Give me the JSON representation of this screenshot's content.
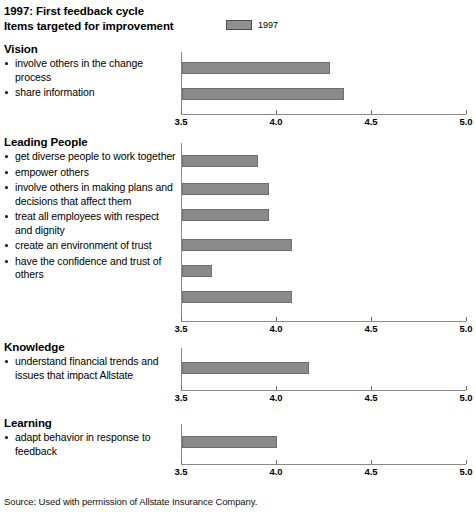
{
  "header": {
    "title_line1": "1997: First feedback cycle",
    "title_line2": "Items targeted for improvement",
    "legend_label": "1997",
    "legend_swatch_color": "#909090"
  },
  "footer": {
    "source": "Source: Used with permission of Allstate Insurance Company."
  },
  "axis": {
    "ticks": [
      "3.5",
      "4.0",
      "4.5",
      "5.0"
    ],
    "min": 3.5,
    "max": 5.0
  },
  "colors": {
    "bar_fill": "#8a8a8a",
    "bar_border": "#6e6e6e",
    "axis": "#8a8a8a",
    "text": "#000000"
  },
  "sections": [
    {
      "heading": "Vision",
      "items": [
        {
          "label": "involve others in the change process",
          "value": 4.28
        },
        {
          "label": "share information",
          "value": 4.35
        }
      ]
    },
    {
      "heading": "Leading People",
      "items": [
        {
          "label": "get diverse people to work together",
          "value": 3.9
        },
        {
          "label": "empower others",
          "value": 3.96
        },
        {
          "label": "involve others in making plans and decisions that affect them",
          "value": 3.96
        },
        {
          "label": "treat all employees with respect and dignity",
          "value": 4.08
        },
        {
          "label": "create an environment of trust",
          "value": 3.66
        },
        {
          "label": "have the confidence and trust of others",
          "value": 4.08
        }
      ]
    },
    {
      "heading": "Knowledge",
      "items": [
        {
          "label": "understand financial trends and issues that impact Allstate",
          "value": 4.17
        }
      ]
    },
    {
      "heading": "Learning",
      "items": [
        {
          "label": "adapt behavior in response to feedback",
          "value": 4.0
        }
      ]
    }
  ],
  "chart_data": {
    "type": "bar",
    "orientation": "horizontal",
    "xlabel": "",
    "ylabel": "",
    "xlim": [
      3.5,
      5.0
    ],
    "xticks": [
      3.5,
      4.0,
      4.5,
      5.0
    ],
    "grid": false,
    "legend": {
      "position": "top-right",
      "entries": [
        "1997"
      ]
    },
    "series": [
      {
        "name": "1997",
        "color": "#8a8a8a",
        "groups": [
          {
            "group": "Vision",
            "categories": [
              "involve others in the change process",
              "share information"
            ],
            "values": [
              4.28,
              4.35
            ]
          },
          {
            "group": "Leading People",
            "categories": [
              "get diverse people to work together",
              "empower others",
              "involve others in making plans and decisions that affect them",
              "treat all employees with respect and dignity",
              "create an environment of trust",
              "have the confidence and trust of others"
            ],
            "values": [
              3.9,
              3.96,
              3.96,
              4.08,
              3.66,
              4.08
            ]
          },
          {
            "group": "Knowledge",
            "categories": [
              "understand financial trends and issues that impact Allstate"
            ],
            "values": [
              4.17
            ]
          },
          {
            "group": "Learning",
            "categories": [
              "adapt behavior in response to feedback"
            ],
            "values": [
              4.0
            ]
          }
        ]
      }
    ],
    "annotations": [
      "Source: Used with permission of Allstate Insurance Company."
    ]
  }
}
